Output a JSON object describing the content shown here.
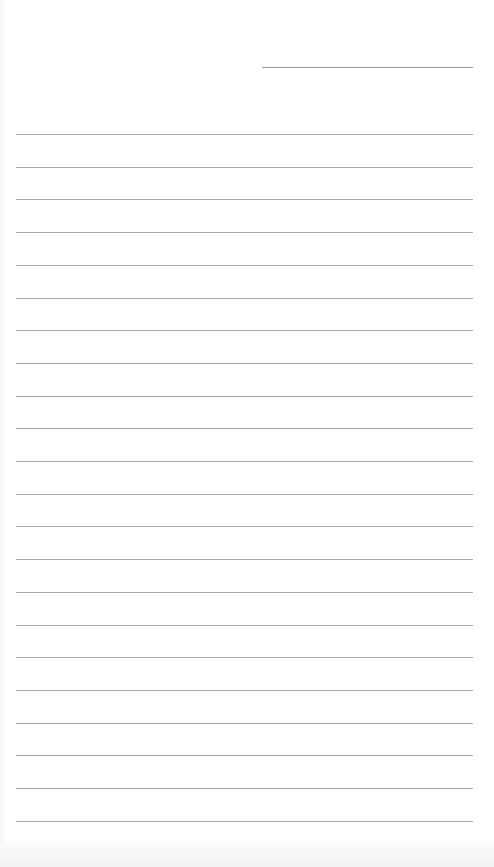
{
  "page": {
    "type": "lined-writing-paper",
    "background_color": "#ffffff",
    "rule_color": "#a8a8a8",
    "header_line": {
      "label": "",
      "left": 262,
      "top": 67,
      "width": 211
    },
    "rules": {
      "count": 22,
      "left": 16,
      "width": 457,
      "first_top": 134,
      "spacing": 32.7
    }
  }
}
